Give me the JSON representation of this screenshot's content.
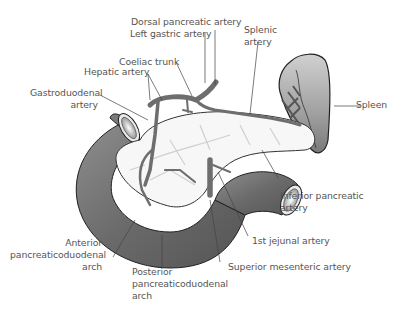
{
  "diagram": {
    "labels": {
      "dorsal_pancreatic_artery": "Dorsal pancreatic artery",
      "left_gastric_artery": "Left gastric artery",
      "coeliac_trunk": "Coeliac trunk",
      "hepatic_artery": "Hepatic artery",
      "gastroduodenal_artery_l1": "Gastroduodenal",
      "gastroduodenal_artery_l2": "artery",
      "splenic_artery_l1": "Splenic",
      "splenic_artery_l2": "artery",
      "spleen": "Spleen",
      "inferior_pancreatic_artery_l1": "Inferior pancreatic",
      "inferior_pancreatic_artery_l2": "artery",
      "first_jejunal_artery": "1st jejunal artery",
      "superior_mesenteric_artery": "Superior mesenteric artery",
      "anterior_pcd_arch_l1": "Anterior",
      "anterior_pcd_arch_l2": "pancreaticoduodenal",
      "anterior_pcd_arch_l3": "arch",
      "posterior_pcd_arch_l1": "Posterior",
      "posterior_pcd_arch_l2": "pancreaticoduodenal",
      "posterior_pcd_arch_l3": "arch"
    },
    "colors": {
      "organ_gray": "#7a7a7a",
      "artery_gray": "#6e6e6e",
      "pancreas_fill": "#f7f7f7",
      "label_text": "#555555",
      "leader_line": "#444444"
    }
  }
}
